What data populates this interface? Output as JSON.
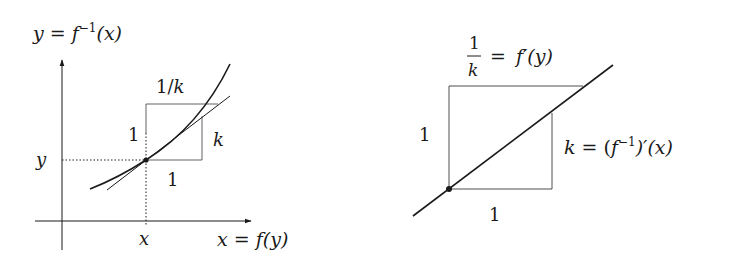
{
  "left_diagram": {
    "title": "y = f⁻¹(x)",
    "title_parts": {
      "lhs": "y",
      "eq": " = ",
      "f": "f",
      "sup": "−1",
      "arg": "(x)"
    },
    "x_axis_label_parts": {
      "lhs": "x",
      "eq": " = ",
      "f": "f",
      "arg": "(y)"
    },
    "x_tick_label": "x",
    "y_tick_label": "y",
    "box_top_label": "1/k",
    "box_top_parts": {
      "one": "1/",
      "k": "k"
    },
    "box_left_label": "1",
    "box_right_label": "k",
    "box_bottom_label": "1"
  },
  "right_diagram": {
    "top_label": "1/k = f′(y)",
    "top_parts": {
      "num": "1",
      "den": "k",
      "eq": "=",
      "f": "f",
      "prime_arg": "′(y)"
    },
    "left_label": "1",
    "bottom_label": "1",
    "right_label": "k = (f⁻¹)′(x)",
    "right_parts": {
      "k": "k",
      "eq": " = (",
      "f": "f",
      "sup": "−1",
      "tail": ")′(x)"
    }
  },
  "colors": {
    "ink": "#1a1a1a",
    "thin": "#3a3a3a",
    "background": "#ffffff"
  }
}
